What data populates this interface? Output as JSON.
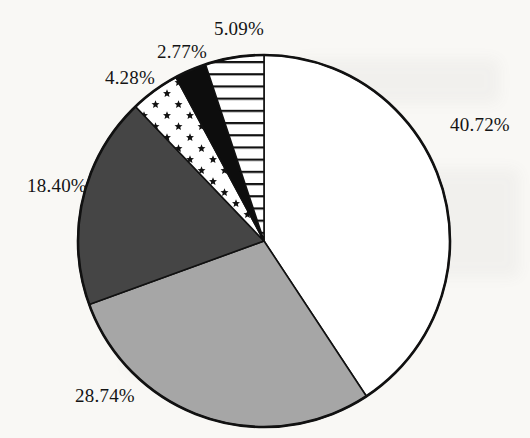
{
  "page": {
    "background_color": "#f9f8f5",
    "text_color": "#141414"
  },
  "chart_data": {
    "type": "pie",
    "title": "",
    "unit": "%",
    "direction": "clockwise",
    "start_angle_deg": 0,
    "outline_color": "#111111",
    "legend": "none",
    "slices": [
      {
        "name": "white-slice",
        "label": "40.72%",
        "value": 40.72,
        "pattern": "solid",
        "color": "#ffffff"
      },
      {
        "name": "medium-gray-slice",
        "label": "28.74%",
        "value": 28.74,
        "pattern": "solid",
        "color": "#a6a6a6"
      },
      {
        "name": "dark-gray-slice",
        "label": "18.40%",
        "value": 18.4,
        "pattern": "solid",
        "color": "#454545"
      },
      {
        "name": "star-pattern-slice",
        "label": "4.28%",
        "value": 4.28,
        "pattern": "stars",
        "color": "#111111"
      },
      {
        "name": "black-slice",
        "label": "2.77%",
        "value": 2.77,
        "pattern": "solid",
        "color": "#0d0d0d"
      },
      {
        "name": "striped-slice",
        "label": "5.09%",
        "value": 5.09,
        "pattern": "hlines",
        "color": "#111111"
      }
    ]
  }
}
